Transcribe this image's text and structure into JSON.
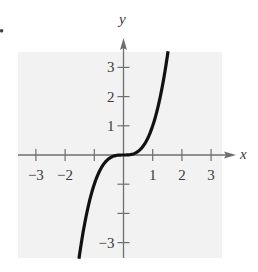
{
  "chart_data": {
    "type": "line",
    "title": "",
    "xlabel": "x",
    "ylabel": "y",
    "xlim": [
      -3.5,
      3.5
    ],
    "ylim": [
      -3.5,
      3.5
    ],
    "grid": false,
    "legend": null,
    "x_ticks": [
      -3,
      -2,
      -1,
      1,
      2,
      3
    ],
    "x_tick_labels": [
      "−3",
      "−2",
      "",
      "1",
      "2",
      "3"
    ],
    "y_ticks": [
      -3,
      -2,
      -1,
      1,
      2,
      3
    ],
    "y_tick_labels": [
      "−3",
      "",
      "",
      "1",
      "2",
      "3"
    ],
    "series": [
      {
        "name": "f(x) = x^3",
        "x": [
          -1.5,
          -1.25,
          -1.0,
          -0.75,
          -0.5,
          -0.25,
          0,
          0.25,
          0.5,
          0.75,
          1.0,
          1.25,
          1.5
        ],
        "y": [
          -3.375,
          -1.953,
          -1.0,
          -0.422,
          -0.125,
          -0.016,
          0,
          0.016,
          0.125,
          0.422,
          1.0,
          1.953,
          3.375
        ]
      }
    ]
  },
  "labels": {
    "x_axis": "x",
    "y_axis": "y",
    "bullet": "•"
  },
  "colors": {
    "background_panel": "#f2f2f2",
    "axis": "#6e6e6e",
    "curve": "#111111"
  }
}
